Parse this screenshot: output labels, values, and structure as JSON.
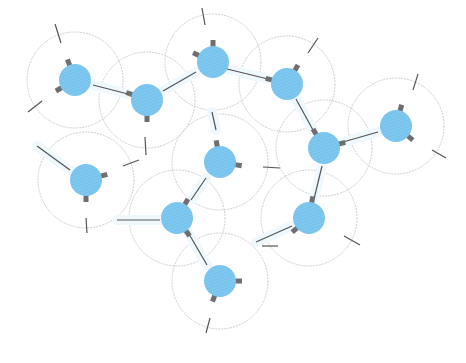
{
  "diagram": {
    "type": "network-of-molecules",
    "colors": {
      "node_fill": "#7ec8f0",
      "node_hatch": "#6bbbe6",
      "stub": "#6e6e6e",
      "bond": "#555555",
      "halo": "#cfcfcf",
      "glow": "#eef8fd",
      "background": "#ffffff"
    },
    "node_radius": 16,
    "halo_radius": 48,
    "nodes": [
      {
        "id": "n1",
        "x": 75,
        "y": 80,
        "stubs": [
          [
            -110,
            8
          ],
          [
            150,
            8
          ],
          [
            20,
            18
          ]
        ]
      },
      {
        "id": "n2",
        "x": 147,
        "y": 100,
        "stubs": [
          [
            200,
            8
          ],
          [
            90,
            8
          ],
          [
            -25,
            18
          ]
        ]
      },
      {
        "id": "n3",
        "x": 213,
        "y": 62,
        "stubs": [
          [
            -90,
            8
          ],
          [
            205,
            8
          ],
          [
            15,
            12
          ]
        ]
      },
      {
        "id": "n4",
        "x": 287,
        "y": 84,
        "stubs": [
          [
            -60,
            8
          ],
          [
            195,
            8
          ],
          [
            60,
            16
          ]
        ]
      },
      {
        "id": "n5",
        "x": 396,
        "y": 126,
        "stubs": [
          [
            -75,
            8
          ],
          [
            40,
            8
          ],
          [
            195,
            20
          ]
        ]
      },
      {
        "id": "n6",
        "x": 324,
        "y": 148,
        "stubs": [
          [
            -120,
            8
          ],
          [
            -15,
            8
          ],
          [
            100,
            18
          ]
        ]
      },
      {
        "id": "n7",
        "x": 86,
        "y": 180,
        "stubs": [
          [
            -15,
            8
          ],
          [
            90,
            8
          ],
          [
            215,
            28
          ]
        ]
      },
      {
        "id": "n8",
        "x": 220,
        "y": 162,
        "stubs": [
          [
            -100,
            8
          ],
          [
            10,
            8
          ],
          [
            135,
            18
          ]
        ]
      },
      {
        "id": "n9",
        "x": 177,
        "y": 218,
        "stubs": [
          [
            -60,
            8
          ],
          [
            55,
            8
          ],
          [
            180,
            32
          ]
        ]
      },
      {
        "id": "n10",
        "x": 309,
        "y": 218,
        "stubs": [
          [
            -80,
            8
          ],
          [
            140,
            8
          ],
          [
            200,
            32
          ]
        ]
      },
      {
        "id": "n11",
        "x": 220,
        "y": 281,
        "stubs": [
          [
            0,
            8
          ],
          [
            110,
            8
          ],
          [
            -130,
            14
          ]
        ]
      }
    ],
    "dangling_bonds": [
      {
        "x1": 55,
        "y1": 24,
        "x2": 61,
        "y2": 43
      },
      {
        "x1": 28,
        "y1": 112,
        "x2": 42,
        "y2": 101
      },
      {
        "x1": 145,
        "y1": 137,
        "x2": 146,
        "y2": 155
      },
      {
        "x1": 123,
        "y1": 166,
        "x2": 139,
        "y2": 160
      },
      {
        "x1": 86,
        "y1": 218,
        "x2": 87,
        "y2": 233
      },
      {
        "x1": 202,
        "y1": 8,
        "x2": 205,
        "y2": 25
      },
      {
        "x1": 318,
        "y1": 38,
        "x2": 308,
        "y2": 53
      },
      {
        "x1": 418,
        "y1": 74,
        "x2": 413,
        "y2": 90
      },
      {
        "x1": 432,
        "y1": 150,
        "x2": 446,
        "y2": 158
      },
      {
        "x1": 263,
        "y1": 167,
        "x2": 280,
        "y2": 168
      },
      {
        "x1": 262,
        "y1": 246,
        "x2": 278,
        "y2": 246
      },
      {
        "x1": 344,
        "y1": 236,
        "x2": 360,
        "y2": 245
      },
      {
        "x1": 206,
        "y1": 333,
        "x2": 210,
        "y2": 318
      }
    ],
    "bonds": [
      {
        "from": "n1",
        "to": "n2",
        "x1": 93,
        "y1": 85,
        "x2": 128,
        "y2": 94
      },
      {
        "from": "n2",
        "to": "n3",
        "x1": 163,
        "y1": 91,
        "x2": 196,
        "y2": 72
      },
      {
        "from": "n3",
        "to": "n4",
        "x1": 227,
        "y1": 69,
        "x2": 268,
        "y2": 79
      },
      {
        "from": "n4",
        "to": "n6",
        "x1": 296,
        "y1": 99,
        "x2": 313,
        "y2": 130
      },
      {
        "from": "n5",
        "to": "n6",
        "x1": 378,
        "y1": 132,
        "x2": 343,
        "y2": 142
      },
      {
        "from": "n6",
        "to": "n10",
        "x1": 322,
        "y1": 166,
        "x2": 314,
        "y2": 199
      },
      {
        "from": "n7",
        "to": "n7",
        "x1": 37,
        "y1": 146,
        "x2": 70,
        "y2": 170
      },
      {
        "from": "n8",
        "to": "n9",
        "x1": 206,
        "y1": 178,
        "x2": 191,
        "y2": 200
      },
      {
        "from": "n9",
        "to": "n11",
        "x1": 189,
        "y1": 234,
        "x2": 207,
        "y2": 265
      },
      {
        "from": "n9",
        "to": "n9",
        "x1": 117,
        "y1": 220,
        "x2": 160,
        "y2": 220
      },
      {
        "from": "n10",
        "to": "n10",
        "x1": 256,
        "y1": 242,
        "x2": 292,
        "y2": 226
      },
      {
        "from": "n3",
        "to": "n8",
        "x1": 212,
        "y1": 112,
        "x2": 216,
        "y2": 130
      }
    ]
  }
}
